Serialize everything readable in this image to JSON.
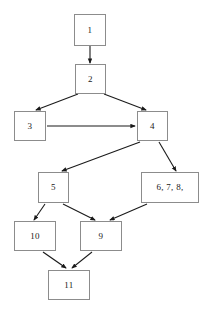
{
  "diagram": {
    "type": "flowchart",
    "title": "",
    "background_color": "#ffffff",
    "node_border_color": "#8c8c8c",
    "node_fill_color": "#ffffff",
    "edge_color": "#1a1a1a",
    "label_color": "#1a1a1a",
    "nodes": [
      {
        "id": "n1",
        "label": "1",
        "x": 74,
        "y": 14,
        "w": 32,
        "h": 32
      },
      {
        "id": "n2",
        "label": "2",
        "x": 75,
        "y": 64,
        "w": 31,
        "h": 30
      },
      {
        "id": "n3",
        "label": "3",
        "x": 14,
        "y": 111,
        "w": 32,
        "h": 30
      },
      {
        "id": "n4",
        "label": "4",
        "x": 137,
        "y": 111,
        "w": 31,
        "h": 30
      },
      {
        "id": "n5",
        "label": "5",
        "x": 38,
        "y": 172,
        "w": 31,
        "h": 31
      },
      {
        "id": "n678",
        "label": "6, 7, 8,",
        "x": 141,
        "y": 172,
        "w": 58,
        "h": 31
      },
      {
        "id": "n10",
        "label": "10",
        "x": 14,
        "y": 221,
        "w": 42,
        "h": 30
      },
      {
        "id": "n9",
        "label": "9",
        "x": 80,
        "y": 221,
        "w": 42,
        "h": 30
      },
      {
        "id": "n11",
        "label": "11",
        "x": 48,
        "y": 270,
        "w": 42,
        "h": 30
      }
    ],
    "edges": [
      {
        "from": "n1",
        "to": "n2",
        "x1": 90,
        "y1": 46,
        "x2": 90,
        "y2": 63
      },
      {
        "from": "n2",
        "to": "n3",
        "x1": 78,
        "y1": 94,
        "x2": 36,
        "y2": 110
      },
      {
        "from": "n2",
        "to": "n4",
        "x1": 104,
        "y1": 94,
        "x2": 146,
        "y2": 110
      },
      {
        "from": "n3",
        "to": "n4",
        "x1": 47,
        "y1": 126,
        "x2": 135,
        "y2": 126
      },
      {
        "from": "n4",
        "to": "n5",
        "x1": 140,
        "y1": 142,
        "x2": 62,
        "y2": 171
      },
      {
        "from": "n4",
        "to": "n678",
        "x1": 159,
        "y1": 142,
        "x2": 176,
        "y2": 171
      },
      {
        "from": "n5",
        "to": "n10",
        "x1": 45,
        "y1": 204,
        "x2": 34,
        "y2": 220
      },
      {
        "from": "n5",
        "to": "n9",
        "x1": 63,
        "y1": 204,
        "x2": 95,
        "y2": 220
      },
      {
        "from": "n678",
        "to": "n9",
        "x1": 147,
        "y1": 204,
        "x2": 110,
        "y2": 220
      },
      {
        "from": "n10",
        "to": "n11",
        "x1": 43,
        "y1": 252,
        "x2": 66,
        "y2": 268
      },
      {
        "from": "n9",
        "to": "n11",
        "x1": 92,
        "y1": 252,
        "x2": 72,
        "y2": 268
      }
    ]
  }
}
